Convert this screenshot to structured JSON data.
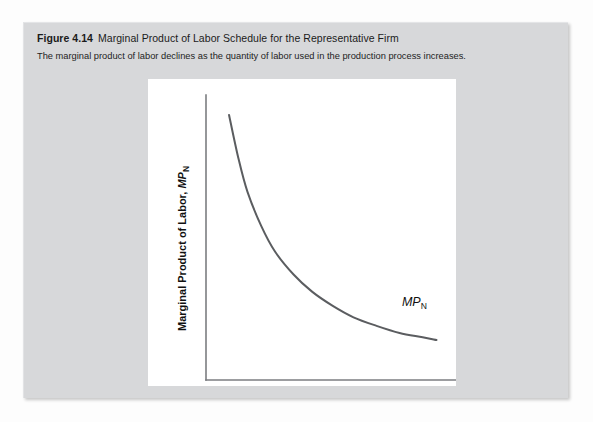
{
  "figure": {
    "number": "Figure 4.14",
    "title": "Marginal Product of Labor Schedule for the Representative Firm",
    "subtitle": "The marginal product of labor declines as the quantity of labor used in the production process increases.",
    "panel_background": "#ffffff",
    "box_background": "#d7d8da"
  },
  "chart_data": {
    "type": "line",
    "title": "Marginal Product of Labor Schedule for the Representative Firm",
    "subtitle": "The marginal product of labor declines as the quantity of labor used in the production process increases.",
    "xlabel_text": "Labor Input, ",
    "xlabel_var": "N",
    "xlabel_sup": "d",
    "ylabel_text": "Marginal Product of Labor, ",
    "ylabel_var": "MP",
    "ylabel_sub": "N",
    "curve_label_var": "MP",
    "curve_label_sub": "N",
    "series": [
      {
        "name": "MP_N",
        "color": "#5b5d60",
        "x": [
          0.1,
          0.14,
          0.18,
          0.24,
          0.3,
          0.38,
          0.46,
          0.55,
          0.64,
          0.74,
          0.84,
          0.94,
          1.0
        ],
        "y": [
          0.93,
          0.78,
          0.66,
          0.54,
          0.45,
          0.37,
          0.31,
          0.26,
          0.22,
          0.19,
          0.165,
          0.15,
          0.14
        ]
      }
    ],
    "xlim": [
      0,
      1.05
    ],
    "ylim": [
      0,
      1.0
    ],
    "grid": false,
    "ticks": false,
    "legend": "inline-label",
    "axis_color": "#7b7d80",
    "annotations": [
      {
        "text": "MP_N",
        "x": 0.85,
        "y": 0.26
      }
    ]
  }
}
